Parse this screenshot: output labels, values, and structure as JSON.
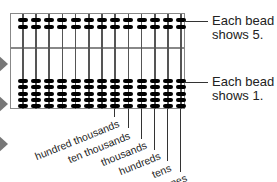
{
  "diagram": {
    "type": "abacus",
    "rods": 13,
    "upper_beads_per_rod": 2,
    "lower_beads_per_rod": 5,
    "labels": {
      "upper": [
        "Each bead",
        "shows 5."
      ],
      "lower": [
        "Each bead",
        "shows 1."
      ]
    },
    "place_values": [
      "hundred thousands",
      "ten thousands",
      "thousands",
      "hundreds",
      "tens",
      "ones"
    ]
  }
}
